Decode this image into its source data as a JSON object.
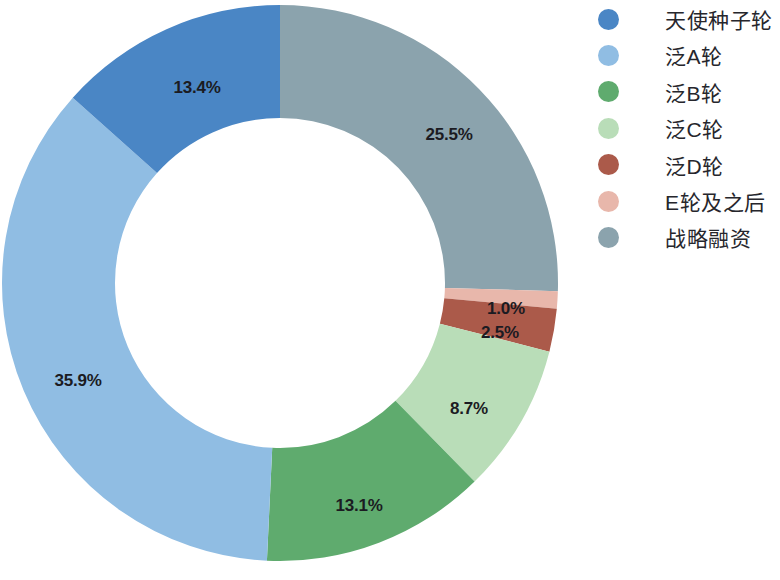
{
  "chart_data": {
    "type": "pie",
    "variant": "donut",
    "title": "",
    "subtitle": "",
    "xlabel": "",
    "ylabel": "",
    "grid": false,
    "legend_position": "right",
    "start_angle_deg": 0,
    "direction": "clockwise",
    "units": "%",
    "geometry": {
      "center_x": 280,
      "center_y": 283,
      "outer_radius": 278,
      "inner_radius": 165
    },
    "categories": [
      "天使种子轮",
      "泛A轮",
      "泛B轮",
      "泛C轮",
      "泛D轮",
      "E轮及之后",
      "战略融资"
    ],
    "values": [
      13.4,
      35.9,
      13.1,
      8.7,
      2.5,
      1.0,
      25.5
    ],
    "colors": [
      "#4a86c5",
      "#90bde3",
      "#5fab6e",
      "#b9ddb8",
      "#ab5a4a",
      "#e8b7ab",
      "#8ba3ad"
    ],
    "slices": [
      {
        "label": "战略融资",
        "value": 25.5,
        "display": "25.5%",
        "color": "#8ba3ad",
        "label_x": 449,
        "label_y": 135
      },
      {
        "label": "E轮及之后",
        "value": 1.0,
        "display": "1.0%",
        "color": "#e8b7ab",
        "label_x": 506,
        "label_y": 309
      },
      {
        "label": "泛D轮",
        "value": 2.5,
        "display": "2.5%",
        "color": "#ab5a4a",
        "label_x": 500,
        "label_y": 333
      },
      {
        "label": "泛C轮",
        "value": 8.7,
        "display": "8.7%",
        "color": "#b9ddb8",
        "label_x": 469,
        "label_y": 409
      },
      {
        "label": "泛B轮",
        "value": 13.1,
        "display": "13.1%",
        "color": "#5fab6e",
        "label_x": 359,
        "label_y": 506
      },
      {
        "label": "泛A轮",
        "value": 35.9,
        "display": "35.9%",
        "color": "#90bde3",
        "label_x": 78,
        "label_y": 381
      },
      {
        "label": "天使种子轮",
        "value": 13.4,
        "display": "13.4%",
        "color": "#4a86c5",
        "label_x": 197,
        "label_y": 88
      }
    ]
  },
  "legend": {
    "items": [
      {
        "label": "天使种子轮",
        "color": "#4a86c5"
      },
      {
        "label": "泛A轮",
        "color": "#90bde3"
      },
      {
        "label": "泛B轮",
        "color": "#5fab6e"
      },
      {
        "label": "泛C轮",
        "color": "#b9ddb8"
      },
      {
        "label": "泛D轮",
        "color": "#ab5a4a"
      },
      {
        "label": "E轮及之后",
        "color": "#e8b7ab"
      },
      {
        "label": "战略融资",
        "color": "#8ba3ad"
      }
    ]
  }
}
